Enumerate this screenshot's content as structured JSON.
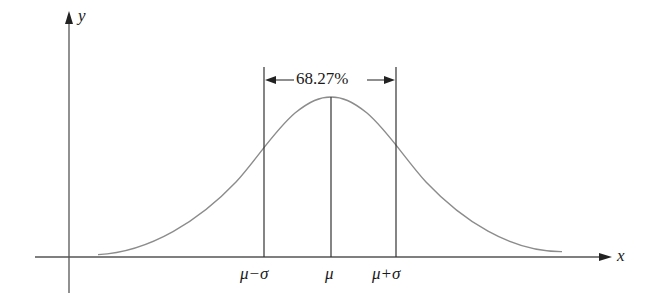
{
  "diagram": {
    "type": "normal-distribution",
    "axes": {
      "x_label": "x",
      "y_label": "y"
    },
    "markers": [
      {
        "id": "mu-minus-sigma",
        "label": "μ−σ"
      },
      {
        "id": "mu",
        "label": "μ"
      },
      {
        "id": "mu-plus-sigma",
        "label": "μ+σ"
      }
    ],
    "interval_label": "68.27%",
    "colors": {
      "curve": "#8c8c8c",
      "axis": "#555555",
      "lines": "#333333",
      "text": "#1a1a1a"
    }
  }
}
